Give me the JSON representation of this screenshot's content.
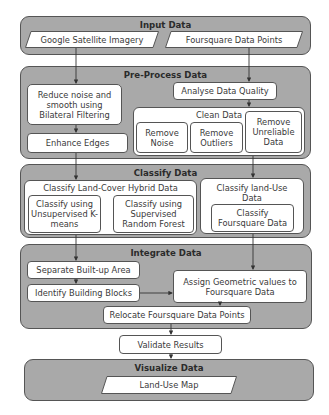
{
  "sections": {
    "input": {
      "title": "Input Data",
      "items": [
        "Google Satellite Imagery",
        "Foursquare Data Points"
      ]
    },
    "preprocess": {
      "title": "Pre-Process Data",
      "reduce_noise": "Reduce noise and smooth using Bilateral Filtering",
      "enhance_edges": "Enhance Edges",
      "analyse_quality": "Analyse Data Quality",
      "clean_data": {
        "title": "Clean Data",
        "items": [
          "Remove Noise",
          "Remove Outliers",
          "Remove Unreliable Data"
        ]
      }
    },
    "classify": {
      "title": "Classify Data",
      "land_cover": {
        "title": "Classify Land-Cover Hybrid Data",
        "items": [
          "Classify using Unsupervised K-means",
          "Classify using Supervised Random Forest"
        ]
      },
      "land_use": {
        "title": "Classify land-Use Data",
        "items": [
          "Classify Foursquare Data"
        ]
      }
    },
    "integrate": {
      "title": "Integrate Data",
      "separate": "Separate Built-up Area",
      "identify": "Identify Building Blocks",
      "assign": "Assign Geometric values to Foursquare Data",
      "relocate": "Relocate Foursquare Data Points"
    },
    "validate": "Validate Results",
    "visualize": {
      "title": "Visualize Data",
      "output": "Land-Use Map"
    }
  },
  "colors": {
    "section_fill": "#a9a9a9",
    "box_fill": "#ffffff",
    "stroke": "#555555"
  }
}
